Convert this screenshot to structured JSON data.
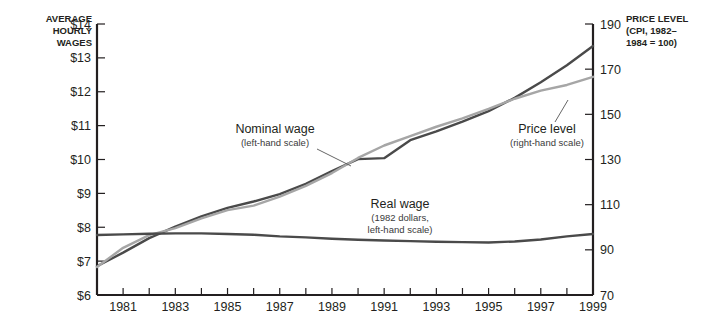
{
  "axes": {
    "left_title_lines": [
      "AVERAGE",
      "HOURLY",
      "WAGES"
    ],
    "right_title_lines": [
      "PRICE LEVEL",
      "(CPI, 1982–",
      "1984 = 100)"
    ],
    "left_ticks": [
      "$14",
      "$13",
      "$12",
      "$11",
      "$10",
      "$9",
      "$8",
      "$7",
      "$6"
    ],
    "right_ticks": [
      "190",
      "170",
      "150",
      "130",
      "110",
      "90",
      "70"
    ],
    "x_ticks": [
      "1981",
      "1983",
      "1985",
      "1987",
      "1989",
      "1991",
      "1993",
      "1995",
      "1997",
      "1999"
    ]
  },
  "annotations": {
    "nominal": {
      "title": "Nominal wage",
      "sub": "(left-hand scale)"
    },
    "price": {
      "title": "Price level",
      "sub": "(right-hand scale)"
    },
    "real": {
      "title": "Real wage",
      "sub1": "(1982 dollars,",
      "sub2": "left-hand scale)"
    }
  },
  "colors": {
    "dark_line": "#4a4a4a",
    "light_line": "#a6a6a6",
    "axis": "#231f20",
    "background": "#ffffff"
  },
  "chart_data": {
    "type": "line",
    "title": "",
    "xlabel": "",
    "ylabel": "Average hourly wages",
    "y2label": "Price level (CPI, 1982-1984 = 100)",
    "grid": false,
    "legend": "annotations-inline",
    "x": [
      1980,
      1981,
      1982,
      1983,
      1984,
      1985,
      1986,
      1987,
      1988,
      1989,
      1990,
      1991,
      1992,
      1993,
      1994,
      1995,
      1996,
      1997,
      1998,
      1999
    ],
    "xlim": [
      1980,
      1999
    ],
    "ylim": [
      6,
      14
    ],
    "y2lim": [
      70,
      190
    ],
    "series": [
      {
        "name": "Nominal wage",
        "scale": "left",
        "units": "dollars per hour",
        "color": "#4a4a4a",
        "values": [
          6.85,
          7.25,
          7.68,
          8.02,
          8.32,
          8.57,
          8.76,
          8.98,
          9.28,
          9.66,
          10.01,
          10.04,
          10.57,
          10.83,
          11.12,
          11.43,
          11.82,
          12.28,
          12.78,
          13.35
        ]
      },
      {
        "name": "Price level",
        "scale": "right",
        "units": "CPI index",
        "color": "#a6a6a6",
        "values": [
          82.4,
          90.9,
          96.5,
          99.6,
          103.9,
          107.6,
          109.6,
          113.6,
          118.3,
          124.0,
          130.7,
          136.2,
          140.3,
          144.5,
          148.2,
          152.4,
          156.9,
          160.5,
          163.0,
          166.6
        ]
      },
      {
        "name": "Real wage",
        "scale": "left",
        "units": "1982 dollars per hour",
        "color": "#4a4a4a",
        "values": [
          7.77,
          7.79,
          7.81,
          7.82,
          7.82,
          7.8,
          7.78,
          7.73,
          7.7,
          7.66,
          7.63,
          7.61,
          7.59,
          7.57,
          7.56,
          7.55,
          7.58,
          7.64,
          7.73,
          7.8
        ]
      }
    ]
  }
}
